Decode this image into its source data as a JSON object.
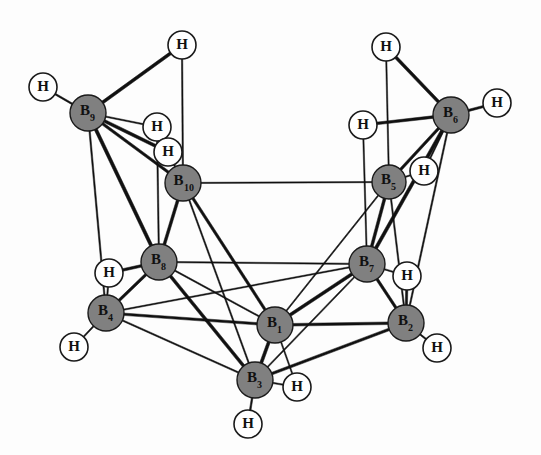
{
  "figure": {
    "background_color": "#fdfdfd",
    "boron_fill": "#808080",
    "boron_stroke": "#1a1a1a",
    "hydrogen_fill": "#ffffff",
    "hydrogen_stroke": "#1a1a1a",
    "bond_color": "#111111",
    "width": 541,
    "height": 455
  },
  "boron_atoms": [
    {
      "id": "B1",
      "label": "B",
      "subscript": "1",
      "x": 275,
      "y": 325,
      "r": 18
    },
    {
      "id": "B2",
      "label": "B",
      "subscript": "2",
      "x": 406,
      "y": 323,
      "r": 18
    },
    {
      "id": "B3",
      "label": "B",
      "subscript": "3",
      "x": 255,
      "y": 380,
      "r": 18
    },
    {
      "id": "B4",
      "label": "B",
      "subscript": "4",
      "x": 106,
      "y": 313,
      "r": 18
    },
    {
      "id": "B5",
      "label": "B",
      "subscript": "5",
      "x": 389,
      "y": 182,
      "r": 17
    },
    {
      "id": "B6",
      "label": "B",
      "subscript": "6",
      "x": 451,
      "y": 115,
      "r": 18
    },
    {
      "id": "B7",
      "label": "B",
      "subscript": "7",
      "x": 367,
      "y": 264,
      "r": 18
    },
    {
      "id": "B8",
      "label": "B",
      "subscript": "8",
      "x": 159,
      "y": 262,
      "r": 18
    },
    {
      "id": "B9",
      "label": "B",
      "subscript": "9",
      "x": 88,
      "y": 113,
      "r": 18
    },
    {
      "id": "B10",
      "label": "B",
      "subscript": "10",
      "x": 183,
      "y": 183,
      "r": 18
    }
  ],
  "hydrogen_atoms": [
    {
      "id": "H_B9_term",
      "label": "H",
      "x": 43,
      "y": 87,
      "r": 14,
      "kind": "terminal"
    },
    {
      "id": "H_top_left",
      "label": "H",
      "x": 182,
      "y": 45,
      "r": 14,
      "kind": "terminal"
    },
    {
      "id": "H_bridge_a",
      "label": "H",
      "x": 157,
      "y": 127,
      "r": 14,
      "kind": "bridging"
    },
    {
      "id": "H_bridge_b",
      "label": "H",
      "x": 168,
      "y": 152,
      "r": 14,
      "kind": "bridging"
    },
    {
      "id": "H_top_right",
      "label": "H",
      "x": 386,
      "y": 47,
      "r": 14,
      "kind": "terminal"
    },
    {
      "id": "H_B6_term",
      "label": "H",
      "x": 497,
      "y": 103,
      "r": 14,
      "kind": "terminal"
    },
    {
      "id": "H_bridge_c",
      "label": "H",
      "x": 363,
      "y": 125,
      "r": 14,
      "kind": "bridging"
    },
    {
      "id": "H_bridge_d",
      "label": "H",
      "x": 424,
      "y": 171,
      "r": 14,
      "kind": "bridging"
    },
    {
      "id": "H_bridge_e",
      "label": "H",
      "x": 109,
      "y": 273,
      "r": 14,
      "kind": "bridging"
    },
    {
      "id": "H_B4_term",
      "label": "H",
      "x": 74,
      "y": 347,
      "r": 14,
      "kind": "terminal"
    },
    {
      "id": "H_B2_term",
      "label": "H",
      "x": 437,
      "y": 348,
      "r": 14,
      "kind": "terminal"
    },
    {
      "id": "H_B7_term",
      "label": "H",
      "x": 407,
      "y": 276,
      "r": 14,
      "kind": "terminal"
    },
    {
      "id": "H_B3_term",
      "label": "H",
      "x": 248,
      "y": 424,
      "r": 14,
      "kind": "terminal"
    },
    {
      "id": "H_bridge_f",
      "label": "H",
      "x": 297,
      "y": 387,
      "r": 14,
      "kind": "bridging"
    }
  ],
  "bonds": [
    {
      "from": "B9",
      "to": "H_B9_term",
      "weight": 1.6
    },
    {
      "from": "B9",
      "to": "H_top_left",
      "weight": 3.0
    },
    {
      "from": "B9",
      "to": "H_bridge_a",
      "weight": 1.3
    },
    {
      "from": "B9",
      "to": "H_bridge_b",
      "weight": 3.0
    },
    {
      "from": "B9",
      "to": "B10",
      "weight": 2.6
    },
    {
      "from": "B9",
      "to": "B8",
      "weight": 3.2
    },
    {
      "from": "B9",
      "to": "B4",
      "weight": 1.4
    },
    {
      "from": "H_top_left",
      "to": "B10",
      "weight": 1.3
    },
    {
      "from": "H_bridge_a",
      "to": "B8",
      "weight": 1.3
    },
    {
      "from": "H_bridge_b",
      "to": "B10",
      "weight": 1.3
    },
    {
      "from": "B10",
      "to": "B5",
      "weight": 1.2
    },
    {
      "from": "B10",
      "to": "B8",
      "weight": 2.8
    },
    {
      "from": "B10",
      "to": "B1",
      "weight": 2.6
    },
    {
      "from": "B10",
      "to": "B3",
      "weight": 1.3
    },
    {
      "from": "B6",
      "to": "H_top_right",
      "weight": 3.0
    },
    {
      "from": "B6",
      "to": "H_B6_term",
      "weight": 2.2
    },
    {
      "from": "B6",
      "to": "H_bridge_c",
      "weight": 2.6
    },
    {
      "from": "B6",
      "to": "H_bridge_d",
      "weight": 1.3
    },
    {
      "from": "B6",
      "to": "B5",
      "weight": 2.6
    },
    {
      "from": "B6",
      "to": "B7",
      "weight": 3.2
    },
    {
      "from": "B6",
      "to": "B2",
      "weight": 1.4
    },
    {
      "from": "H_top_right",
      "to": "B5",
      "weight": 1.2
    },
    {
      "from": "H_bridge_c",
      "to": "B7",
      "weight": 1.2
    },
    {
      "from": "H_bridge_d",
      "to": "B5",
      "weight": 1.2
    },
    {
      "from": "B5",
      "to": "B7",
      "weight": 2.8
    },
    {
      "from": "B5",
      "to": "B2",
      "weight": 1.3
    },
    {
      "from": "B5",
      "to": "B1",
      "weight": 1.2
    },
    {
      "from": "B8",
      "to": "B7",
      "weight": 1.3
    },
    {
      "from": "B8",
      "to": "B4",
      "weight": 2.6
    },
    {
      "from": "B8",
      "to": "B1",
      "weight": 1.3
    },
    {
      "from": "B8",
      "to": "B3",
      "weight": 3.0
    },
    {
      "from": "B8",
      "to": "H_bridge_e",
      "weight": 2.6
    },
    {
      "from": "B7",
      "to": "B1",
      "weight": 3.0
    },
    {
      "from": "B7",
      "to": "B2",
      "weight": 2.6
    },
    {
      "from": "B7",
      "to": "B3",
      "weight": 1.3
    },
    {
      "from": "B7",
      "to": "H_B7_term",
      "weight": 1.3
    },
    {
      "from": "B7",
      "to": "B4",
      "weight": 1.2
    },
    {
      "from": "H_B7_term",
      "to": "B2",
      "weight": 2.2
    },
    {
      "from": "H_bridge_e",
      "to": "B4",
      "weight": 1.3
    },
    {
      "from": "B4",
      "to": "H_B4_term",
      "weight": 1.4
    },
    {
      "from": "B4",
      "to": "B1",
      "weight": 2.4
    },
    {
      "from": "B4",
      "to": "B3",
      "weight": 1.4
    },
    {
      "from": "B1",
      "to": "B3",
      "weight": 3.0
    },
    {
      "from": "B1",
      "to": "B2",
      "weight": 2.6
    },
    {
      "from": "B1",
      "to": "H_bridge_f",
      "weight": 1.2
    },
    {
      "from": "B2",
      "to": "H_B2_term",
      "weight": 1.4
    },
    {
      "from": "B2",
      "to": "B3",
      "weight": 2.6
    },
    {
      "from": "B3",
      "to": "H_B3_term",
      "weight": 1.6
    },
    {
      "from": "B3",
      "to": "H_bridge_f",
      "weight": 1.3
    }
  ]
}
